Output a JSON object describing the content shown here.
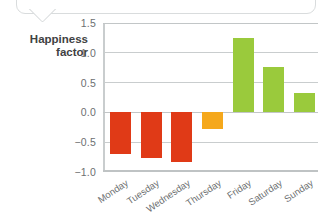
{
  "figure": {
    "axis_title_line1": "Happiness",
    "axis_title_line2": "factor"
  },
  "chart_data": {
    "type": "bar",
    "title": "",
    "xlabel": "",
    "ylabel": "Happiness factor",
    "categories": [
      "Monday",
      "Tuesday",
      "Wednesday",
      "Thursday",
      "Friday",
      "Saturday",
      "Sunday"
    ],
    "values": [
      -0.69,
      -0.76,
      -0.84,
      -0.28,
      1.24,
      0.76,
      0.32
    ],
    "colors": [
      "#e03a17",
      "#e03a17",
      "#e03a17",
      "#f5a81c",
      "#9aca3c",
      "#9aca3c",
      "#9aca3c"
    ],
    "ylim": [
      -1.0,
      1.5
    ],
    "yticks": [
      "1.5",
      "1.0",
      "0.5",
      "0.0",
      "−0.5",
      "−1.0"
    ],
    "ytick_values": [
      1.5,
      1.0,
      0.5,
      0.0,
      -0.5,
      -1.0
    ],
    "grid": true,
    "legend": "none",
    "bar_color_negative": "#e03a17",
    "bar_color_neutral": "#f5a81c",
    "bar_color_positive": "#9aca3c",
    "grid_color": "#c9cdce",
    "text_color": "#6d6f71"
  }
}
